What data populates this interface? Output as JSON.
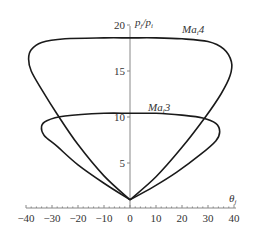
{
  "chart_data": {
    "type": "line",
    "title": "",
    "xlabel": "θj",
    "ylabel": "pj/pi",
    "xlim": [
      -40,
      40
    ],
    "ylim": [
      0,
      20
    ],
    "xticks": [
      -40,
      -30,
      -20,
      -10,
      0,
      10,
      20,
      30,
      40
    ],
    "yticks": [
      5,
      10,
      15,
      20
    ],
    "grid": false,
    "legend": "none (inline curve labels)",
    "series": [
      {
        "name": "Mai4",
        "label": "MaiA",
        "closed": true,
        "points": [
          [
            0,
            1.0
          ],
          [
            -10,
            3.6
          ],
          [
            -20,
            7.0
          ],
          [
            -28,
            10.3
          ],
          [
            -34,
            13.0
          ],
          [
            -38,
            15.0
          ],
          [
            -39,
            16.3
          ],
          [
            -38,
            17.3
          ],
          [
            -34,
            18.1
          ],
          [
            -25,
            18.5
          ],
          [
            -10,
            18.6
          ],
          [
            0,
            18.6
          ],
          [
            10,
            18.6
          ],
          [
            20,
            18.5
          ],
          [
            30,
            18.2
          ],
          [
            36,
            17.4
          ],
          [
            39,
            16.0
          ],
          [
            38.5,
            14.5
          ],
          [
            35,
            12.5
          ],
          [
            29,
            10.0
          ],
          [
            20,
            6.7
          ],
          [
            10,
            3.5
          ],
          [
            0,
            1.0
          ]
        ],
        "label_position": [
          24,
          19.3
        ]
      },
      {
        "name": "Mai3",
        "label": "Mai3",
        "closed": true,
        "points": [
          [
            0,
            1.0
          ],
          [
            -10,
            2.8
          ],
          [
            -20,
            4.8
          ],
          [
            -28,
            6.8
          ],
          [
            -33,
            8.0
          ],
          [
            -34,
            9.0
          ],
          [
            -32,
            9.6
          ],
          [
            -25,
            10.1
          ],
          [
            -10,
            10.4
          ],
          [
            0,
            10.4
          ],
          [
            10,
            10.4
          ],
          [
            20,
            10.2
          ],
          [
            28,
            9.9
          ],
          [
            33,
            9.3
          ],
          [
            34.5,
            8.4
          ],
          [
            33,
            7.4
          ],
          [
            27,
            5.9
          ],
          [
            18,
            4.0
          ],
          [
            9,
            2.4
          ],
          [
            0,
            1.0
          ]
        ],
        "label_position": [
          9,
          10.9
        ]
      }
    ]
  },
  "axes": {
    "y_title_main": "p",
    "y_title_sub1": "j",
    "y_title_slash": "/p",
    "y_title_sub2": "i",
    "x_title_main": "θ",
    "x_title_sub": "j",
    "x_tick_labels": [
      "−40",
      "−30",
      "−20",
      "−10",
      "0",
      "10",
      "20",
      "30",
      "40"
    ],
    "y_tick_labels": [
      "5",
      "10",
      "15",
      "20"
    ]
  },
  "labels": {
    "ma4_main": "Ma",
    "ma4_sub": "i",
    "ma4_num": "4",
    "ma3_main": "Ma",
    "ma3_sub": "i",
    "ma3_num": "3"
  }
}
